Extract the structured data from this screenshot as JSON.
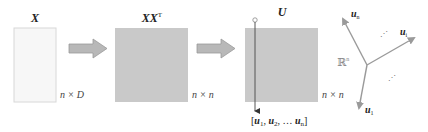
{
  "diagram": {
    "matrices": [
      {
        "id": "X",
        "title": "X",
        "dims": "n × D",
        "fill": "#f7f7f7",
        "stroke": "#d8d8d8"
      },
      {
        "id": "XXT",
        "title": "XX",
        "title_sup": "T",
        "dims": "n × n",
        "fill": "#c9c9c9",
        "stroke": "#c9c9c9"
      },
      {
        "id": "U",
        "title": "U",
        "dims": "n × n",
        "fill": "#c9c9c9",
        "stroke": "#c9c9c9"
      }
    ],
    "arrows": [
      {
        "from": "X",
        "to": "XXT",
        "fill": "#b8b8b8",
        "stroke": "#9a9a9a"
      },
      {
        "from": "XXT",
        "to": "U",
        "fill": "#b8b8b8",
        "stroke": "#9a9a9a"
      }
    ],
    "column_vector_list": {
      "open": "[",
      "items": [
        "u",
        "u",
        "u"
      ],
      "subs": [
        "1",
        "2",
        "n"
      ],
      "sep1": ", ",
      "sep2": ", … ",
      "close": "]"
    },
    "vector_space": {
      "space_label": "ℝ",
      "space_sup": "n",
      "vectors": [
        {
          "label": "u",
          "sub": "n"
        },
        {
          "label": "u",
          "sub": "i"
        },
        {
          "label": "u",
          "sub": "1"
        }
      ],
      "ellipsis_top": "⋰",
      "ellipsis_bottom": "⋰"
    },
    "colors": {
      "vector_stroke": "#9a9a9a",
      "line_stroke": "#555555",
      "text": "#222222",
      "dim_text": "#444444"
    }
  }
}
